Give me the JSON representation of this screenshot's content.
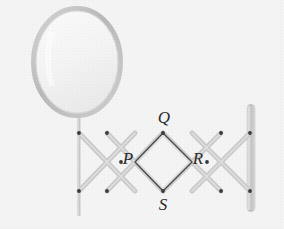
{
  "figure": {
    "background_color": "#f4f4f4",
    "labels": [
      {
        "id": "P",
        "text": "P",
        "x": 128,
        "y": 160
      },
      {
        "id": "Q",
        "text": "Q",
        "x": 164,
        "y": 119
      },
      {
        "id": "R",
        "text": "R",
        "x": 198,
        "y": 160
      },
      {
        "id": "S",
        "text": "S",
        "x": 163,
        "y": 205
      }
    ],
    "mirror": {
      "name": "oval-mirror",
      "center_x": 77,
      "center_y": 62,
      "radius_x": 44,
      "radius_y": 54,
      "frame_color": "#c3c3c3",
      "frame_width": 5,
      "glass_color": "#f7f7f7"
    },
    "left_post": {
      "name": "mirror-support-post",
      "x": 79,
      "y_top": 100,
      "y_bottom": 216,
      "width": 3,
      "color": "#c9c9c9"
    },
    "right_bar": {
      "name": "wall-mounting-bar",
      "x": 251,
      "y_top": 104,
      "y_bottom": 212,
      "width": 9,
      "color": "#c9c9c9"
    },
    "arm_color": "#cbcbcb",
    "arm_width": 5,
    "highlight_color": "#bdbdbd",
    "pivot_color": "#3a3a3a",
    "pivot_radius": 1.8,
    "diamond_stroke": "#4a4a4a",
    "diamond_width": 1.4,
    "lattice": {
      "y_top": 133,
      "y_mid": 162,
      "y_bottom": 191,
      "x_nodes": [
        79,
        107,
        135,
        163,
        192,
        221,
        250
      ],
      "description": "Scissor lattice with alternating top/bottom and middle pivot points"
    },
    "pivots_top": [
      {
        "x": 107,
        "y": 133
      },
      {
        "x": 163,
        "y": 133
      },
      {
        "x": 221,
        "y": 133
      }
    ],
    "pivots_mid": [
      {
        "x": 79,
        "y": 133
      },
      {
        "x": 93,
        "y": 162
      },
      {
        "x": 135,
        "y": 162
      },
      {
        "x": 192,
        "y": 162
      },
      {
        "x": 236,
        "y": 162
      }
    ],
    "pivots_bottom": [
      {
        "x": 79,
        "y": 191
      },
      {
        "x": 107,
        "y": 191
      },
      {
        "x": 163,
        "y": 191
      },
      {
        "x": 221,
        "y": 191
      },
      {
        "x": 250,
        "y": 191
      }
    ],
    "pivots_anchor": [
      {
        "x": 250,
        "y": 133
      }
    ]
  }
}
